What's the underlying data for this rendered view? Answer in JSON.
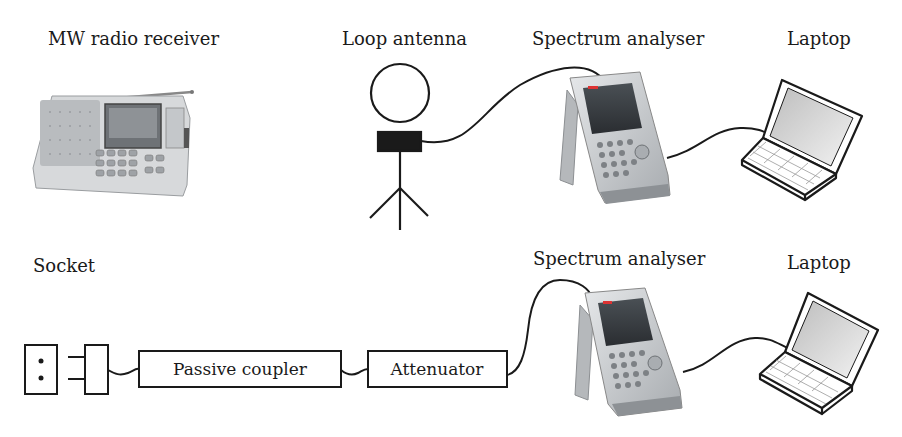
{
  "top_row": {
    "radio_label": "MW radio receiver",
    "antenna_label": "Loop antenna",
    "analyser_label": "Spectrum analyser",
    "laptop_label": "Laptop"
  },
  "bottom_row": {
    "socket_label": "Socket",
    "coupler_label": "Passive coupler",
    "attenuator_label": "Attenuator",
    "analyser_label": "Spectrum analyser",
    "laptop_label": "Laptop"
  },
  "colors": {
    "line": "#1a1a1a",
    "device_body": "#c9cccf",
    "device_screen": "#3a3f44",
    "laptop_screen": "#d8d8d8"
  }
}
